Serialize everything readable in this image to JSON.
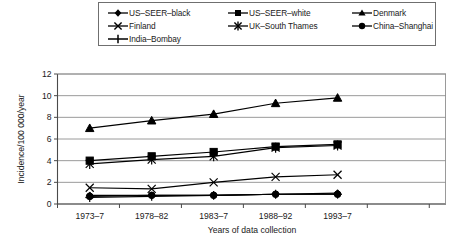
{
  "chart_data": {
    "type": "line",
    "title": "",
    "xlabel": "Years of data collection",
    "ylabel": "Incidence/100 000/year",
    "categories": [
      "1973–7",
      "1978–82",
      "1983–7",
      "1988–92",
      "1993–7"
    ],
    "ylim": [
      0,
      12
    ],
    "yticks": [
      0,
      2,
      4,
      6,
      8,
      10,
      12
    ],
    "grid": true,
    "legend_position": "top",
    "series": [
      {
        "name": "US–SEER–black",
        "marker": "diamond",
        "values": [
          0.8,
          0.8,
          0.8,
          0.9,
          1.0
        ]
      },
      {
        "name": "US–SEER–white",
        "marker": "square",
        "values": [
          4.0,
          4.4,
          4.8,
          5.3,
          5.5
        ]
      },
      {
        "name": "Denmark",
        "marker": "triangle",
        "values": [
          7.0,
          7.7,
          8.3,
          9.3,
          9.8
        ]
      },
      {
        "name": "Finland",
        "marker": "cross",
        "values": [
          1.5,
          1.4,
          2.0,
          2.5,
          2.7
        ]
      },
      {
        "name": "UK–South Thames",
        "marker": "asterisk",
        "values": [
          3.7,
          4.1,
          4.4,
          5.2,
          5.4
        ]
      },
      {
        "name": "China–Shanghai",
        "marker": "circle",
        "values": [
          0.7,
          0.8,
          0.8,
          0.9,
          0.9
        ]
      },
      {
        "name": "India–Bombay",
        "marker": "plus",
        "values": [
          0.6,
          0.7,
          0.8,
          0.9,
          0.9
        ]
      }
    ]
  },
  "legend": {
    "items": [
      {
        "label": "US–SEER–black",
        "icon": "diamond-marker-icon"
      },
      {
        "label": "US–SEER–white",
        "icon": "square-marker-icon"
      },
      {
        "label": "Denmark",
        "icon": "triangle-marker-icon"
      },
      {
        "label": "Finland",
        "icon": "cross-marker-icon"
      },
      {
        "label": "UK–South Thames",
        "icon": "asterisk-marker-icon"
      },
      {
        "label": "China–Shanghai",
        "icon": "circle-marker-icon"
      },
      {
        "label": "India–Bombay",
        "icon": "plus-marker-icon"
      }
    ]
  },
  "axes": {
    "y_label": "Incidence/100 000/year",
    "x_label": "Years of data collection",
    "y_ticks": [
      "0",
      "2",
      "4",
      "6",
      "8",
      "10",
      "12"
    ],
    "x_ticks": [
      "1973–7",
      "1978–82",
      "1983–7",
      "1988–92",
      "1993–7"
    ]
  },
  "colors": {
    "series": "#000000",
    "grid": "#8e8e8e",
    "axis": "#4a4a4a",
    "text": "#1a1a1a",
    "background": "#ffffff"
  }
}
